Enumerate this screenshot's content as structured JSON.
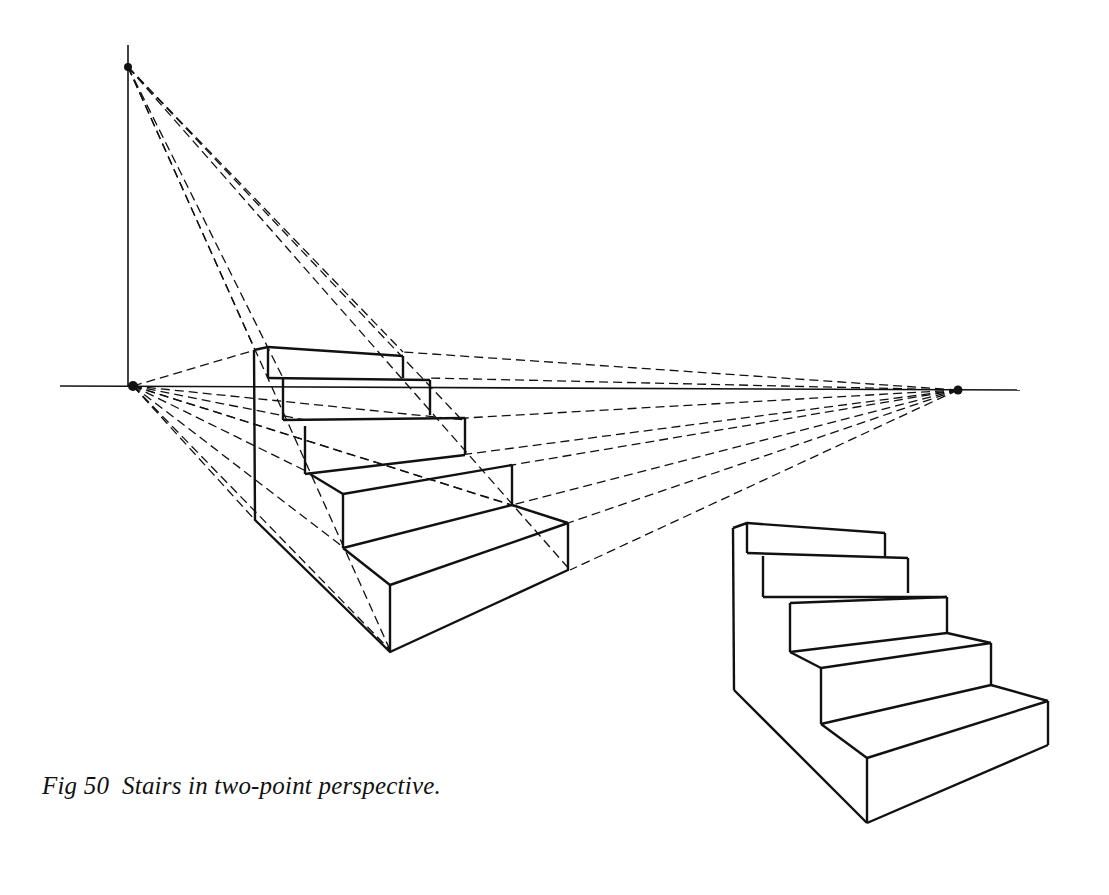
{
  "figure": {
    "caption": "Fig 50  Stairs in two-point perspective.",
    "number": "50",
    "title": "Stairs in two-point perspective",
    "ink_color": "#111111",
    "background": "#ffffff"
  },
  "diagram": {
    "horizon_line_y": 388,
    "vanishing_points": {
      "left": [
        133,
        386
      ],
      "right": [
        958,
        390
      ],
      "vertical": [
        128,
        67
      ]
    },
    "construction_drawing": {
      "steps": 5,
      "line_style_construction": "dashed",
      "line_style_object": "solid"
    },
    "finished_drawing": {
      "steps": 5
    }
  }
}
